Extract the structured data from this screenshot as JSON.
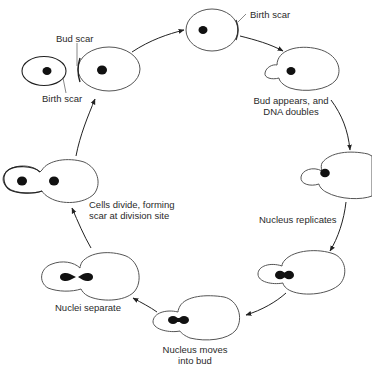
{
  "diagram": {
    "type": "cell-cycle",
    "colors": {
      "outline": "#555555",
      "nucleus": "#111111",
      "arrow": "#222222",
      "text": "#2a2a2a",
      "background": "#ffffff"
    },
    "stages": [
      {
        "id": "newborn",
        "label": "Birth scar"
      },
      {
        "id": "bud-appears",
        "label_line1": "Bud appears, and",
        "label_line2": "DNA doubles"
      },
      {
        "id": "nucleus-replicates",
        "label": "Nucleus replicates"
      },
      {
        "id": "nucleus-moves",
        "label_line1": "Nucleus moves",
        "label_line2": "into bud"
      },
      {
        "id": "nuclei-separate",
        "label": "Nuclei separate"
      },
      {
        "id": "cells-divide",
        "label_line1": "Cells divide, forming",
        "label_line2": "scar at division site"
      },
      {
        "id": "separated",
        "labels": {
          "bud_scar": "Bud scar",
          "birth_scar": "Birth scar"
        }
      }
    ]
  }
}
